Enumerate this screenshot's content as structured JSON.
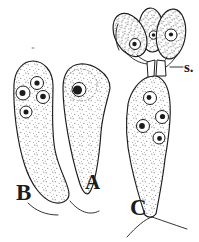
{
  "figure": {
    "labels": {
      "b": "B",
      "a": "A",
      "c": "C",
      "s": "s."
    }
  },
  "colors": {
    "ink": "#1c1c1c",
    "paper": "#ffffff"
  }
}
